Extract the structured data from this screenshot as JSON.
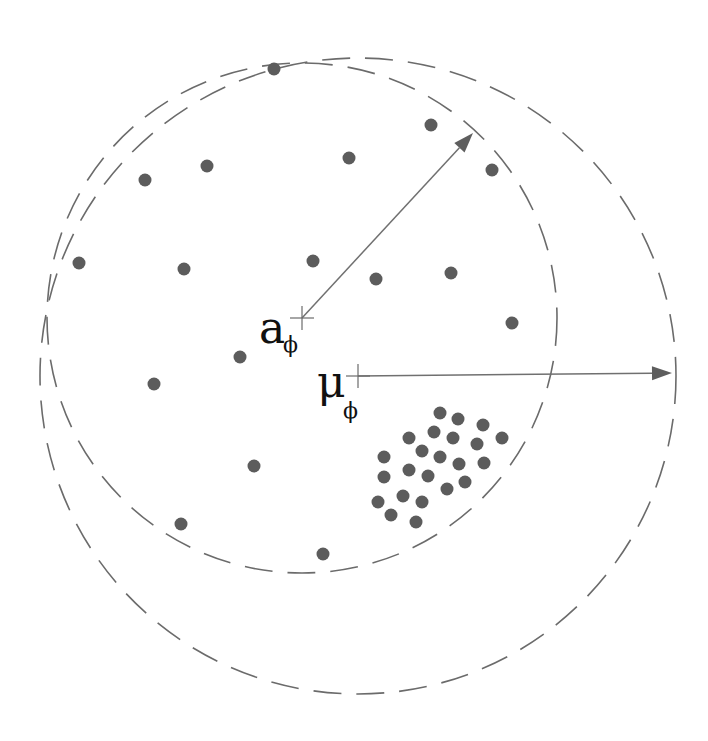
{
  "diagram": {
    "labels": {
      "a_main": "a",
      "a_sub": "ϕ",
      "mu_main": "μ",
      "mu_sub": "ϕ"
    },
    "colors": {
      "dot": "#5c5c5c",
      "line": "#6b6b6b",
      "text": "#111111"
    },
    "centers": {
      "a_phi": [
        302,
        318
      ],
      "mu_phi": [
        358,
        376
      ]
    },
    "circles": [
      {
        "name": "inner-circle-around-a",
        "cx": 302,
        "cy": 318,
        "r": 255,
        "style": "dashed"
      },
      {
        "name": "outer-circle-around-mu",
        "cx": 358,
        "cy": 376,
        "r": 318,
        "style": "dashed"
      }
    ],
    "arrows": [
      {
        "name": "radius-arrow-a",
        "from": [
          302,
          318
        ],
        "to": [
          473,
          133
        ]
      },
      {
        "name": "radius-arrow-mu",
        "from": [
          358,
          376
        ],
        "to": [
          672,
          373
        ]
      }
    ],
    "scattered_points": [
      [
        274,
        69
      ],
      [
        431,
        125
      ],
      [
        492,
        170
      ],
      [
        145,
        180
      ],
      [
        207,
        166
      ],
      [
        349,
        158
      ],
      [
        79,
        263
      ],
      [
        184,
        269
      ],
      [
        313,
        261
      ],
      [
        376,
        279
      ],
      [
        451,
        273
      ],
      [
        512,
        323
      ],
      [
        240,
        357
      ],
      [
        154,
        384
      ],
      [
        254,
        466
      ],
      [
        181,
        524
      ],
      [
        323,
        554
      ]
    ],
    "cluster_points": [
      [
        440,
        413
      ],
      [
        458,
        419
      ],
      [
        483,
        425
      ],
      [
        502,
        438
      ],
      [
        434,
        432
      ],
      [
        453,
        438
      ],
      [
        477,
        444
      ],
      [
        409,
        438
      ],
      [
        422,
        451
      ],
      [
        440,
        457
      ],
      [
        459,
        464
      ],
      [
        484,
        463
      ],
      [
        384,
        457
      ],
      [
        409,
        470
      ],
      [
        428,
        476
      ],
      [
        447,
        489
      ],
      [
        465,
        482
      ],
      [
        384,
        477
      ],
      [
        403,
        496
      ],
      [
        422,
        502
      ],
      [
        378,
        502
      ],
      [
        391,
        515
      ],
      [
        416,
        522
      ]
    ]
  }
}
